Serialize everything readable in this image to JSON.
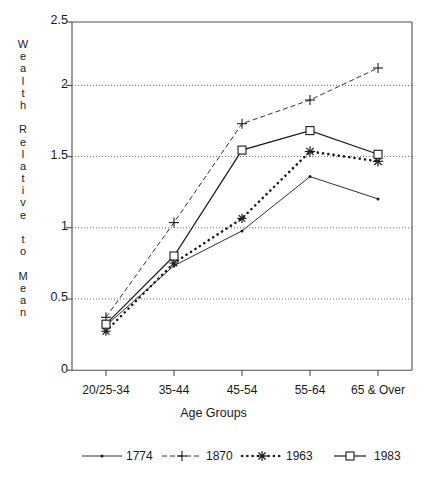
{
  "chart_data": {
    "type": "line",
    "title": "",
    "xlabel": "Age Groups",
    "ylabel": "Wealth Relative to Mean",
    "categories": [
      "20/25-34",
      "35-44",
      "45-54",
      "55-64",
      "65 & Over"
    ],
    "ylim": [
      0,
      2.5
    ],
    "yticks": [
      0,
      0.5,
      1,
      1.5,
      2,
      2.5
    ],
    "ytick_labels": [
      "0",
      "0.5",
      "1",
      "1.5",
      "2",
      "2.5"
    ],
    "grid": "horizontal-dotted",
    "legend_position": "bottom",
    "series": [
      {
        "name": "1774",
        "marker": "dot",
        "line": "solid-thin",
        "values": [
          0.32,
          0.75,
          1.0,
          1.39,
          1.23
        ]
      },
      {
        "name": "1870",
        "marker": "plus",
        "line": "dashed",
        "values": [
          0.38,
          1.06,
          1.77,
          1.94,
          2.17
        ]
      },
      {
        "name": "1963",
        "marker": "star",
        "line": "dotted-thick",
        "values": [
          0.28,
          0.77,
          1.09,
          1.57,
          1.5
        ]
      },
      {
        "name": "1983",
        "marker": "square",
        "line": "solid",
        "values": [
          0.33,
          0.82,
          1.58,
          1.72,
          1.55
        ]
      }
    ]
  },
  "axis": {
    "ylabel_chars": [
      "W",
      "e",
      "a",
      "l",
      "t",
      "h",
      "",
      "R",
      "e",
      "l",
      "a",
      "t",
      "i",
      "v",
      "e",
      "",
      "t",
      "o",
      "",
      "M",
      "e",
      "a",
      "n"
    ],
    "xlabel": "Age Groups",
    "ytick_labels": [
      "2.5",
      "2",
      "1.5",
      "1",
      "0.5",
      "0"
    ],
    "xtick_labels": [
      "20/25-34",
      "35-44",
      "45-54",
      "55-64",
      "65 & Over"
    ]
  },
  "legend": {
    "items": [
      {
        "label": "1774",
        "marker": "dot-icon"
      },
      {
        "label": "1870",
        "marker": "plus-icon"
      },
      {
        "label": "1963",
        "marker": "star-icon"
      },
      {
        "label": "1983",
        "marker": "square-icon"
      }
    ]
  },
  "colors": {
    "ink": "#1a1a1a",
    "axis": "#555555",
    "grid": "#777777",
    "background": "#ffffff"
  }
}
